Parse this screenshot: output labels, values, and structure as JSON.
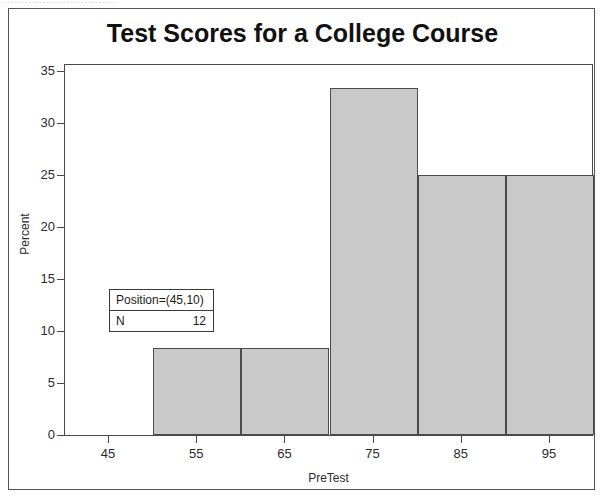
{
  "figure": {
    "top_artifact_text": "................................"
  },
  "chart_data": {
    "type": "bar",
    "title": "Test Scores for a College Course",
    "xlabel": "PreTest",
    "ylabel": "Percent",
    "grid": false,
    "legend_position": "none",
    "xlim": [
      40,
      100
    ],
    "ylim": [
      0,
      35
    ],
    "x_ticks": [
      "45",
      "55",
      "65",
      "75",
      "85",
      "95"
    ],
    "x_tick_values": [
      45,
      55,
      65,
      75,
      85,
      95
    ],
    "y_ticks": [
      "0",
      "5",
      "10",
      "15",
      "20",
      "25",
      "30",
      "35"
    ],
    "y_tick_values": [
      0,
      5,
      10,
      15,
      20,
      25,
      30,
      35
    ],
    "bin_width": 10,
    "bins": [
      {
        "label": "45",
        "center": 45,
        "start": 40,
        "end": 50,
        "value": 0
      },
      {
        "label": "55",
        "center": 55,
        "start": 50,
        "end": 60,
        "value": 8.33
      },
      {
        "label": "65",
        "center": 65,
        "start": 60,
        "end": 70,
        "value": 8.33
      },
      {
        "label": "75",
        "center": 75,
        "start": 70,
        "end": 80,
        "value": 33.33
      },
      {
        "label": "85",
        "center": 85,
        "start": 80,
        "end": 90,
        "value": 25
      },
      {
        "label": "95",
        "center": 95,
        "start": 90,
        "end": 100,
        "value": 25
      }
    ],
    "categories": [
      "45",
      "55",
      "65",
      "75",
      "85",
      "95"
    ],
    "values": [
      0,
      8.33,
      8.33,
      33.33,
      25,
      25
    ],
    "bar_fill_color": "#c9c9c9",
    "bar_border_color": "#4a4a4a"
  },
  "inset": {
    "position_label": "Position=(45,10)",
    "n_label": "N",
    "n_value": "12"
  }
}
